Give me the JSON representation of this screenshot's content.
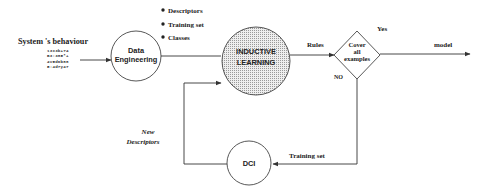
{
  "diagram": {
    "input": {
      "label": "System 's behaviour",
      "data_rows": [
        "13x3b+74",
        "B3:385*+",
        "4v5d6b88",
        "5:4d7y47"
      ]
    },
    "nodes": {
      "data_engineering": {
        "line1": "Data",
        "line2": "Engineering"
      },
      "inductive_learning": {
        "line1": "INDUCTIVE",
        "line2": "LEARNING"
      },
      "decision": {
        "line1": "Cover",
        "line2": "all",
        "line3": "examples"
      },
      "dci": {
        "label": "DCI"
      }
    },
    "bullets": [
      "Descriptors",
      "Training set",
      "Classes"
    ],
    "edge_labels": {
      "rules": "Rules",
      "yes": "Yes",
      "no": "NO",
      "model": "model",
      "training_set": "Training set",
      "new_descriptors_line1": "New",
      "new_descriptors_line2": "Descriptors"
    },
    "colors": {
      "stroke": "#333333",
      "fill_dots": "#bbbbbb",
      "background": "#ffffff"
    }
  }
}
